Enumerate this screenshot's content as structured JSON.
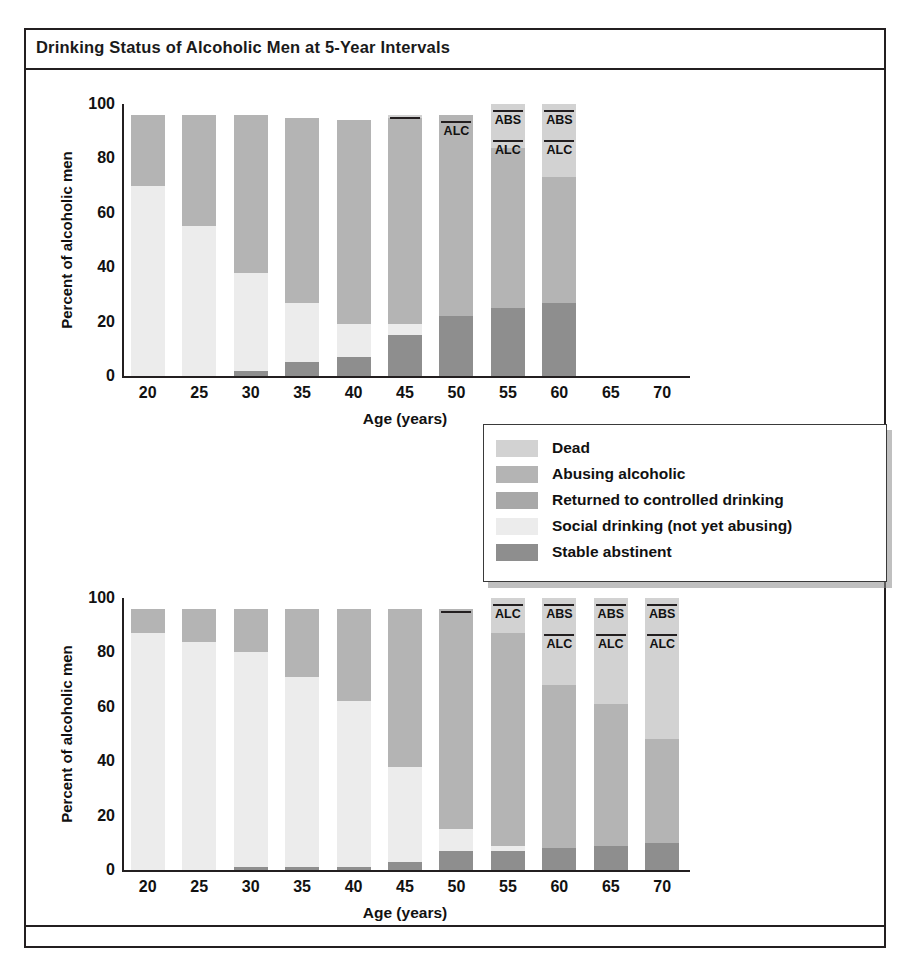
{
  "figure": {
    "title": "Drinking Status of Alcoholic Men at 5-Year Intervals"
  },
  "legend": {
    "position": "center-right",
    "items": [
      {
        "label": "Dead",
        "color": "#d2d2d2"
      },
      {
        "label": "Abusing alcoholic",
        "color": "#b4b4b4"
      },
      {
        "label": "Returned to controlled drinking",
        "color": "#a8a8a8"
      },
      {
        "label": "Social drinking (not yet abusing)",
        "color": "#ececec"
      },
      {
        "label": "Stable abstinent",
        "color": "#8e8e8e"
      }
    ]
  },
  "colors": {
    "dead": "#d2d2d2",
    "abusing": "#b4b4b4",
    "controlled": "#a8a8a8",
    "social": "#ececec",
    "abstinent": "#8e8e8e",
    "axis": "#231f20"
  },
  "annotations": {
    "abs": "ABS",
    "alc": "ALC"
  },
  "chart_data": [
    {
      "id": "top",
      "type": "bar",
      "subtype": "stacked",
      "title": "",
      "xlabel": "Age (years)",
      "ylabel": "Percent of alcoholic men",
      "ylim": [
        0,
        100
      ],
      "yticks": [
        0,
        20,
        40,
        60,
        80,
        100
      ],
      "grid": false,
      "categories": [
        20,
        25,
        30,
        35,
        40,
        45,
        50,
        55,
        60,
        65,
        70
      ],
      "series": [
        {
          "name": "Stable abstinent",
          "values": [
            0,
            0,
            2,
            5,
            7,
            15,
            22,
            25,
            27,
            null,
            null
          ]
        },
        {
          "name": "Social drinking (not yet abusing)",
          "values": [
            70,
            55,
            36,
            22,
            12,
            4,
            0,
            0,
            0,
            null,
            null
          ]
        },
        {
          "name": "Abusing alcoholic",
          "values": [
            26,
            41,
            58,
            68,
            75,
            76,
            74,
            59,
            46,
            null,
            null
          ]
        },
        {
          "name": "Dead",
          "values": [
            0,
            0,
            0,
            0,
            0,
            1,
            0,
            16,
            27,
            null,
            null
          ]
        }
      ],
      "bar_tops": [
        96,
        96,
        96,
        95,
        94,
        96,
        96,
        100,
        100,
        null,
        null
      ],
      "bar_annotations": [
        null,
        null,
        null,
        null,
        null,
        {
          "labels": []
        },
        {
          "labels": [
            "ALC"
          ]
        },
        {
          "labels": [
            "ABS",
            "ALC"
          ]
        },
        {
          "labels": [
            "ABS",
            "ALC"
          ]
        },
        null,
        null
      ]
    },
    {
      "id": "bottom",
      "type": "bar",
      "subtype": "stacked",
      "title": "",
      "xlabel": "Age (years)",
      "ylabel": "Percent of alcoholic men",
      "ylim": [
        0,
        100
      ],
      "yticks": [
        0,
        20,
        40,
        60,
        80,
        100
      ],
      "grid": false,
      "categories": [
        20,
        25,
        30,
        35,
        40,
        45,
        50,
        55,
        60,
        65,
        70
      ],
      "series": [
        {
          "name": "Stable abstinent",
          "values": [
            0,
            0,
            1,
            1,
            1,
            3,
            7,
            7,
            8,
            9,
            10
          ]
        },
        {
          "name": "Social drinking (not yet abusing)",
          "values": [
            87,
            84,
            79,
            70,
            61,
            35,
            8,
            2,
            0,
            0,
            0
          ]
        },
        {
          "name": "Abusing alcoholic",
          "values": [
            9,
            12,
            16,
            25,
            34,
            58,
            81,
            78,
            60,
            52,
            38
          ]
        },
        {
          "name": "Dead",
          "values": [
            0,
            0,
            0,
            0,
            0,
            0,
            0,
            13,
            32,
            39,
            52
          ]
        }
      ],
      "bar_tops": [
        96,
        96,
        96,
        96,
        96,
        96,
        96,
        100,
        100,
        100,
        100
      ],
      "bar_annotations": [
        null,
        null,
        null,
        null,
        null,
        null,
        {
          "labels": []
        },
        {
          "labels": [
            "ALC"
          ]
        },
        {
          "labels": [
            "ABS",
            "ALC"
          ]
        },
        {
          "labels": [
            "ABS",
            "ALC"
          ]
        },
        {
          "labels": [
            "ABS",
            "ALC"
          ]
        }
      ]
    }
  ]
}
